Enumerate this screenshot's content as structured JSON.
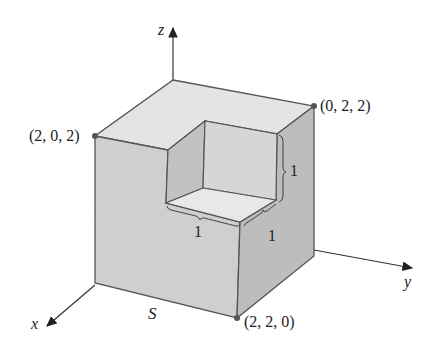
{
  "figure": {
    "surface_label": "S",
    "axes": {
      "x": "x",
      "y": "y",
      "z": "z"
    },
    "points": [
      {
        "id": "p202",
        "label": "(2, 0, 2)"
      },
      {
        "id": "p022",
        "label": "(0, 2, 2)"
      },
      {
        "id": "p220",
        "label": "(2, 2, 0)"
      }
    ],
    "dimensions": [
      {
        "id": "dim_vertical",
        "label": "1"
      },
      {
        "id": "dim_front",
        "label": "1"
      },
      {
        "id": "dim_side",
        "label": "1"
      }
    ],
    "colors": {
      "top": "#e4e4e4",
      "front": "#cfcfcf",
      "side": "#bdbdbd",
      "edge": "#555555",
      "point": "#555555"
    }
  }
}
